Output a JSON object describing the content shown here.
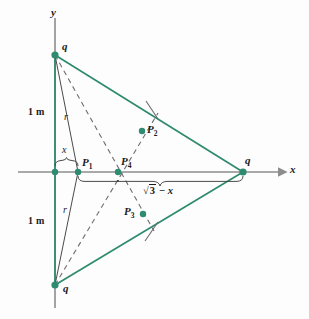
{
  "figure": {
    "background": "#fdfdfd",
    "colors": {
      "charge_green": "#2e8b6f",
      "axis_gray": "#8c8c8c",
      "dashed_gray": "#6d6d6d",
      "text_black": "#1b1b1b"
    }
  },
  "axes": {
    "x_label": "x",
    "y_label": "y"
  },
  "charges": [
    {
      "id": "charge-top",
      "label": "q",
      "x": 55,
      "y": 55
    },
    {
      "id": "charge-right",
      "label": "q",
      "x": 243,
      "y": 172
    },
    {
      "id": "charge-bottom",
      "label": "q",
      "x": 55,
      "y": 285
    }
  ],
  "field_points": [
    {
      "id": "P1",
      "label": "P",
      "sub": "1",
      "x": 78,
      "y": 172
    },
    {
      "id": "P2",
      "label": "P",
      "sub": "2",
      "x": 142,
      "y": 131
    },
    {
      "id": "P3",
      "label": "P",
      "sub": "3",
      "x": 143,
      "y": 214
    },
    {
      "id": "P4",
      "label": "P",
      "sub": "4",
      "x": 118,
      "y": 172
    }
  ],
  "dimension_labels": {
    "upper_side": "1 m",
    "lower_side": "1 m",
    "upper_radius": "r",
    "lower_radius": "r",
    "small_segment": "x",
    "long_segment": "3 − x",
    "long_segment_radical": "√",
    "long_segment_radicand": "3",
    "long_segment_rest": " − x"
  }
}
